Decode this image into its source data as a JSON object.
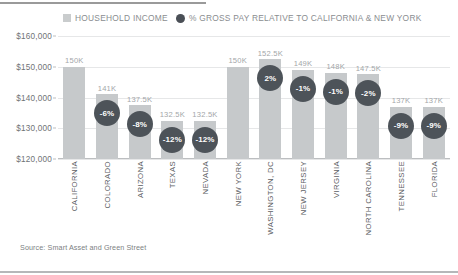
{
  "legend": {
    "items": [
      {
        "label": "HOUSEHOLD INCOME",
        "marker": "square-swatch-icon",
        "color": "#c9cccd"
      },
      {
        "label": "% GROSS PAY RELATIVE TO CALIFORNIA & NEW YORK",
        "marker": "circle-swatch-icon",
        "color": "#4a4f56"
      }
    ]
  },
  "source": "Source: Smart Asset and Green Street",
  "chart_data": {
    "type": "bar",
    "title": "",
    "subtitle": "",
    "xlabel": "",
    "ylabel": "",
    "ylim": [
      120000,
      160000
    ],
    "ytick_labels": [
      "$160,000",
      "$150,000",
      "$140,000",
      "$130,000",
      "$120,000"
    ],
    "ytick_values": [
      160000,
      150000,
      140000,
      130000,
      120000
    ],
    "grid": true,
    "legend_position": "top",
    "categories": [
      "CALIFORNIA",
      "COLORADO",
      "ARIZONA",
      "TEXAS",
      "NEVADA",
      "NEW YORK",
      "WASHINGTON, DC",
      "NEW JERSEY",
      "VIRGINIA",
      "NORTH CAROLINA",
      "TENNESSEE",
      "FLORIDA"
    ],
    "series": [
      {
        "name": "HOUSEHOLD INCOME",
        "color": "#c6c9cb",
        "values": [
          150000,
          141000,
          137500,
          132500,
          132500,
          150000,
          152500,
          149000,
          148000,
          147500,
          137000,
          137000
        ],
        "labels": [
          "150K",
          "141K",
          "137.5K",
          "132.5K",
          "132.5K",
          "150K",
          "152.5K",
          "149K",
          "148K",
          "147.5K",
          "137K",
          "137K"
        ]
      },
      {
        "name": "% GROSS PAY RELATIVE TO CALIFORNIA & NEW YORK",
        "color": "#4d5359",
        "values": [
          null,
          -6,
          -8,
          -12,
          -12,
          null,
          2,
          -1,
          -1,
          -2,
          -9,
          -9
        ],
        "labels": [
          "",
          "-6%",
          "-8%",
          "-12%",
          "-12%",
          "",
          "2%",
          "-1%",
          "-1%",
          "-2%",
          "-9%",
          "-9%"
        ]
      }
    ]
  }
}
